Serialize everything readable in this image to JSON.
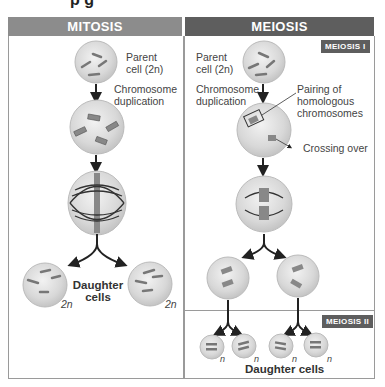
{
  "title_fragment": "p g",
  "mitosis": {
    "header": "MITOSIS",
    "header_color": "#8a8a8a",
    "parent_label_1": "Parent",
    "parent_label_2": "cell (2n)",
    "dup_label_1": "Chromosome",
    "dup_label_2": "duplication",
    "daughter_label_1": "Daughter",
    "daughter_label_2": "cells",
    "ploidy_left": "2n",
    "ploidy_right": "2n"
  },
  "meiosis": {
    "header": "MEIOSIS",
    "header_color": "#5e5e5e",
    "stage1_tag": "MEIOSIS I",
    "stage2_tag": "MEIOSIS II",
    "parent_label_1": "Parent",
    "parent_label_2": "cell (2n)",
    "dup_label_1": "Chromosome",
    "dup_label_2": "duplication",
    "pairing_label_1": "Pairing of",
    "pairing_label_2": "homologous",
    "pairing_label_3": "chromosomes",
    "crossing_label": "Crossing over",
    "ploidy": [
      "n",
      "n",
      "n",
      "n"
    ],
    "daughter_label": "Daughter cells"
  }
}
